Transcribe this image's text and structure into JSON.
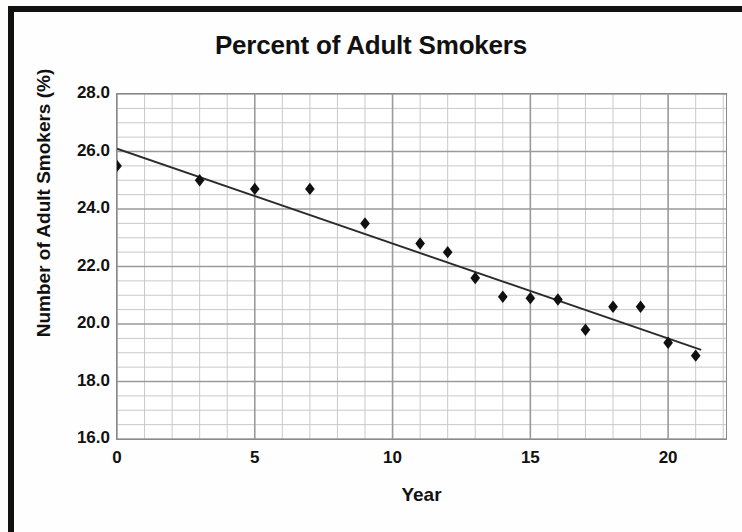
{
  "chart_data": {
    "type": "scatter",
    "title": "Percent of Adult Smokers",
    "xlabel": "Year",
    "ylabel": "Number of Adult Smokers (%)",
    "xlim": [
      0,
      22.1
    ],
    "ylim": [
      16.0,
      28.0
    ],
    "xticks": [
      0,
      5,
      10,
      15,
      20
    ],
    "yticks": [
      "16.0",
      "18.0",
      "20.0",
      "22.0",
      "24.0",
      "26.0",
      "28.0"
    ],
    "ytick_values": [
      16.0,
      18.0,
      20.0,
      22.0,
      24.0,
      26.0,
      28.0
    ],
    "x_major_step": 5,
    "x_minor_step": 1,
    "y_major_step": 2.0,
    "y_minor_step": 0.5,
    "grid": true,
    "legend": "none",
    "marker": "diamond",
    "marker_color": "#101010",
    "gridline_color": "#9a9a9a",
    "minor_gridline_color": "#c9c9c9",
    "axis_color": "#6e6e6e",
    "trendline_color": "#2b2b2b",
    "series": [
      {
        "name": "Percent of Adult Smokers",
        "x": [
          0,
          3,
          5,
          7,
          9,
          11,
          12,
          13,
          14,
          15,
          16,
          17,
          18,
          19,
          20,
          21
        ],
        "values": [
          25.5,
          25.0,
          24.7,
          24.7,
          23.5,
          22.8,
          22.5,
          21.6,
          20.95,
          20.9,
          20.85,
          19.8,
          20.6,
          20.6,
          19.35,
          18.9
        ]
      }
    ],
    "trendline": {
      "name": "Linear trendline",
      "x_start": 0,
      "y_start": 26.1,
      "x_end": 21.2,
      "y_end": 19.1
    }
  }
}
